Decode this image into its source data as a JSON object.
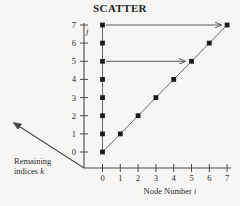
{
  "chart_data": {
    "type": "scatter",
    "title": "SCATTER",
    "xlabel": "Node Number i",
    "ylabel": "j",
    "diagonal_axis_label_line1": "Remaining",
    "diagonal_axis_label_line2": "indices k",
    "xlim": [
      0,
      7
    ],
    "ylim": [
      0,
      7
    ],
    "xticks": [
      "0",
      "1",
      "2",
      "3",
      "4",
      "5",
      "6",
      "7"
    ],
    "yticks": [
      "0",
      "1",
      "2",
      "3",
      "4",
      "5",
      "6",
      "7"
    ],
    "grid": false,
    "legend": "none",
    "marker": "filled-square",
    "marker_color": "#1c1c1c",
    "line_color": "#555555",
    "axis_color": "#4a4a4a",
    "background": "#f7f6f4",
    "series": [
      {
        "name": "vertical-column-i-equals-0",
        "x": [
          0,
          0,
          0,
          0,
          0,
          0,
          0,
          0
        ],
        "y": [
          0,
          1,
          2,
          3,
          4,
          5,
          6,
          7
        ],
        "connected": true
      },
      {
        "name": "diagonal-j-equals-i",
        "x": [
          0,
          1,
          2,
          3,
          4,
          5,
          6,
          7
        ],
        "y": [
          0,
          1,
          2,
          3,
          4,
          5,
          6,
          7
        ],
        "connected": true
      }
    ],
    "annotations": [
      {
        "name": "sweep-arrow-row-7",
        "type": "arrow",
        "from": [
          0,
          7
        ],
        "to": [
          7,
          7
        ]
      },
      {
        "name": "sweep-arrow-row-5",
        "type": "arrow",
        "from": [
          0,
          5
        ],
        "to": [
          5,
          5
        ]
      },
      {
        "name": "remaining-indices-axis-arrow",
        "type": "arrow",
        "direction": "up-left",
        "label": "Remaining indices k"
      }
    ]
  }
}
